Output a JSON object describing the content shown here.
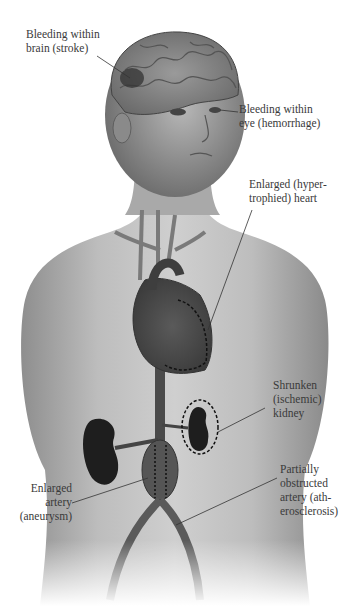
{
  "figure": {
    "colors": {
      "skin_light": "#c9c9c9",
      "skin_mid": "#a8a8a8",
      "skin_dark": "#6e6e6e",
      "organ_dark": "#2a2a2a",
      "vessel": "#555555",
      "leader_line": "#333333",
      "label_text": "#3a3a3a",
      "background": "#ffffff"
    }
  },
  "labels": [
    {
      "id": "brain",
      "text": "Bleeding within\nbrain (stroke)"
    },
    {
      "id": "eye",
      "text": "Bleeding within\neye (hemorrhage)"
    },
    {
      "id": "heart",
      "text": "Enlarged (hyper-\ntrophied) heart"
    },
    {
      "id": "kidney",
      "text": "Shrunken\n(ischemic)\nkidney"
    },
    {
      "id": "aneurysm",
      "text": "Enlarged\nartery\n(aneurysm)"
    },
    {
      "id": "atherosclerosis",
      "text": "Partially\nobstructed\nartery (ath-\nerosclerosis)"
    }
  ]
}
